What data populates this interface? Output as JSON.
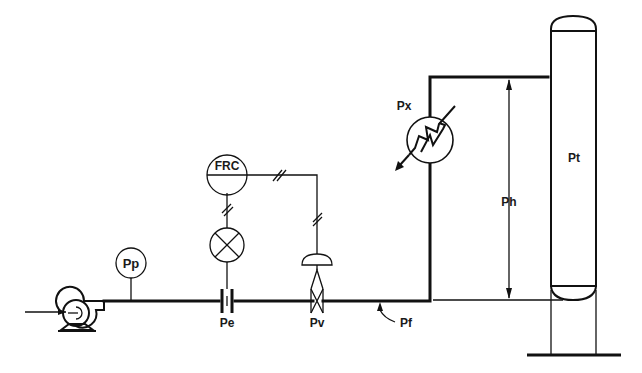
{
  "diagram": {
    "type": "process-flow (pressure drop loop)",
    "labels": {
      "pump_pressure": "Pp",
      "orifice_element": "Pe",
      "flow_controller": "FRC",
      "control_valve": "Pv",
      "line_friction": "Pf",
      "heat_exchanger": "Px",
      "elevation_head": "Ph",
      "tower": "Pt"
    },
    "colors": {
      "line": "#111111",
      "background": "#ffffff"
    }
  }
}
